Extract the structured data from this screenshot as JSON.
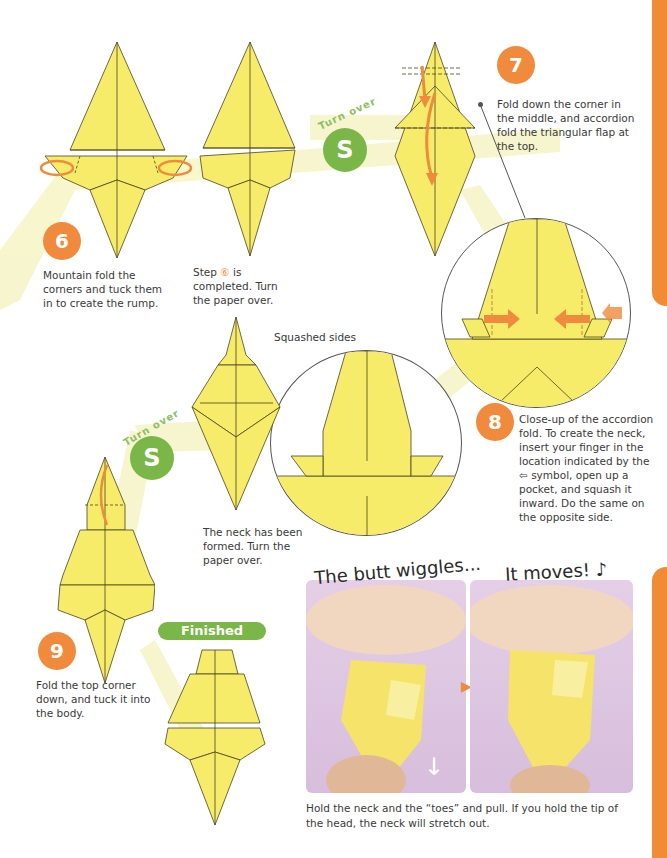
{
  "page": {
    "colors": {
      "accent_orange": "#f08a3c",
      "accent_green": "#7ab648",
      "paper_yellow": "#f7ec6a",
      "path_yellow": "#f7f5c8",
      "photo_bg": "#dcc4e0"
    }
  },
  "steps": [
    {
      "number": "6",
      "text": "Mountain fold the corners and tuck them in to create the rump."
    },
    {
      "number": "",
      "text_before": "Step",
      "ref": "⑥",
      "text_after": "is completed. Turn the paper over."
    },
    {
      "number": "7",
      "text": "Fold down the corner in the middle, and accordion fold the triangular flap at the top."
    },
    {
      "number": "8",
      "text": "Close-up of the accordion fold. To create the neck, insert your finger in the location indicated by the ⇦ symbol, open up a pocket, and squash it inward. Do the same on the opposite side."
    },
    {
      "number": "",
      "label": "Squashed sides",
      "text": "The neck has been formed. Turn the paper over."
    },
    {
      "number": "9",
      "text": "Fold the top corner down, and tuck it into the body."
    }
  ],
  "turn_over": {
    "label": "Turn over",
    "icon": "turn-over-icon",
    "glyph": "S"
  },
  "finished": {
    "label": "Finished"
  },
  "photos": {
    "left_caption": "The butt wiggles...",
    "right_caption": "It moves! ♪",
    "arrow_glyph": "▶",
    "pull_glyph": "↓",
    "description": "Hold the neck and the “toes” and pull. If you hold the tip of the head, the neck will stretch out."
  }
}
